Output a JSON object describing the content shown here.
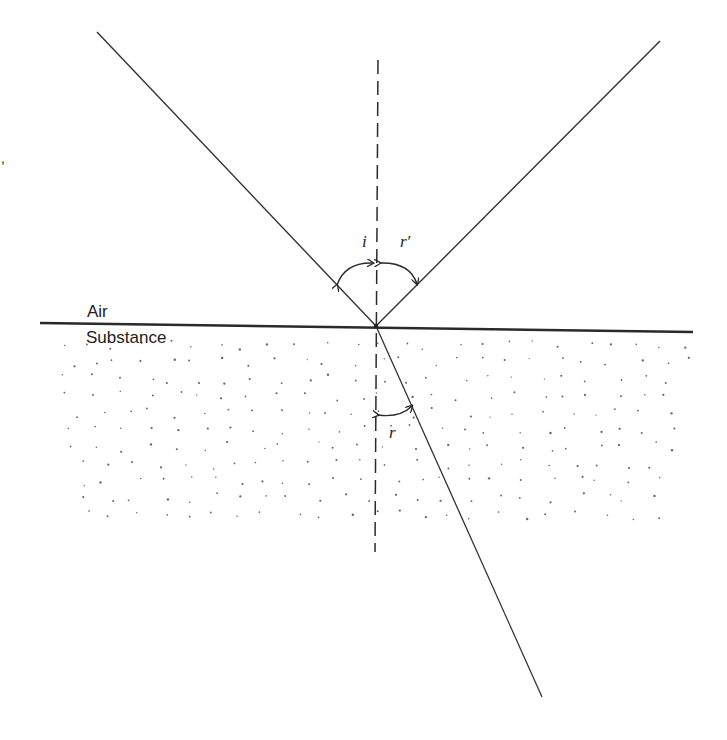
{
  "diagram": {
    "type": "refraction-reflection",
    "media": {
      "upper_label": "Air",
      "lower_label": "Substance"
    },
    "angles": {
      "incidence": "i",
      "reflection": "r′",
      "refraction": "r"
    },
    "stray_mark": ",",
    "colors": {
      "line": "#2a2a2a",
      "dots": "#555555",
      "background": "#ffffff"
    }
  }
}
